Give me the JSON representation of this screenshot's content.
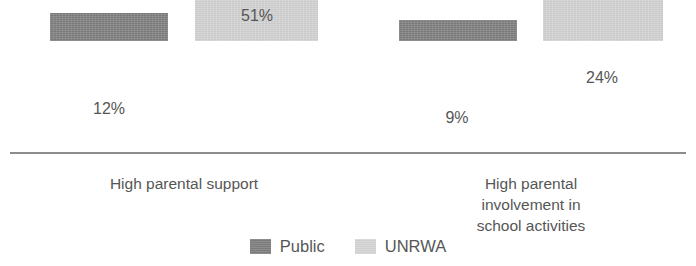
{
  "chart_data": {
    "type": "bar",
    "title": "",
    "subtitle": "",
    "xlabel": "",
    "ylabel": "",
    "grid": false,
    "axis": "baseline-only",
    "ylim": [
      0,
      60
    ],
    "legend_position": "bottom-center",
    "categories": [
      "High parental support",
      "High parental involvement in\nschool activities"
    ],
    "series": [
      {
        "name": "Public",
        "color": "#808080",
        "values": [
          12,
          9
        ],
        "labels": [
          "12%",
          "9%"
        ]
      },
      {
        "name": "UNRWA",
        "color": "#d4d4d4",
        "values": [
          51,
          24
        ],
        "labels": [
          "51%",
          "24%"
        ]
      }
    ]
  },
  "legend": {
    "items": [
      {
        "label": "Public",
        "color": "#808080"
      },
      {
        "label": "UNRWA",
        "color": "#d4d4d4"
      }
    ]
  }
}
